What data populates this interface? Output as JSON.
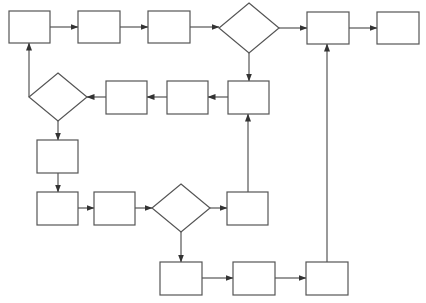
{
  "diagram": {
    "type": "flowchart",
    "stroke_color": "#555555",
    "background": "#ffffff",
    "nodes": [
      {
        "id": "p1",
        "shape": "process",
        "label": "",
        "x": 9,
        "y": 11,
        "w": 41,
        "h": 32
      },
      {
        "id": "p2",
        "shape": "process",
        "label": "",
        "x": 78,
        "y": 11,
        "w": 42,
        "h": 32
      },
      {
        "id": "p3",
        "shape": "process",
        "label": "",
        "x": 148,
        "y": 11,
        "w": 42,
        "h": 32
      },
      {
        "id": "d1",
        "shape": "decision",
        "label": "",
        "cx": 249,
        "cy": 28,
        "rw": 30,
        "rh": 25
      },
      {
        "id": "p4",
        "shape": "process",
        "label": "",
        "x": 307,
        "y": 12,
        "w": 42,
        "h": 32
      },
      {
        "id": "p5",
        "shape": "process",
        "label": "",
        "x": 377,
        "y": 12,
        "w": 42,
        "h": 32
      },
      {
        "id": "p6",
        "shape": "process",
        "label": "",
        "x": 228,
        "y": 81,
        "w": 41,
        "h": 33
      },
      {
        "id": "p7",
        "shape": "process",
        "label": "",
        "x": 167,
        "y": 81,
        "w": 41,
        "h": 33
      },
      {
        "id": "p8",
        "shape": "process",
        "label": "",
        "x": 106,
        "y": 81,
        "w": 41,
        "h": 33
      },
      {
        "id": "d2",
        "shape": "decision",
        "label": "",
        "cx": 58,
        "cy": 97,
        "rw": 29,
        "rh": 24
      },
      {
        "id": "p9",
        "shape": "process",
        "label": "",
        "x": 37,
        "y": 140,
        "w": 41,
        "h": 33
      },
      {
        "id": "p10",
        "shape": "process",
        "label": "",
        "x": 37,
        "y": 192,
        "w": 41,
        "h": 33
      },
      {
        "id": "p11",
        "shape": "process",
        "label": "",
        "x": 94,
        "y": 192,
        "w": 41,
        "h": 33
      },
      {
        "id": "d3",
        "shape": "decision",
        "label": "",
        "cx": 181,
        "cy": 208,
        "rw": 29,
        "rh": 24
      },
      {
        "id": "p12",
        "shape": "process",
        "label": "",
        "x": 227,
        "y": 192,
        "w": 41,
        "h": 33
      },
      {
        "id": "p13",
        "shape": "process",
        "label": "",
        "x": 160,
        "y": 262,
        "w": 42,
        "h": 33
      },
      {
        "id": "p14",
        "shape": "process",
        "label": "",
        "x": 233,
        "y": 262,
        "w": 42,
        "h": 33
      },
      {
        "id": "p15",
        "shape": "process",
        "label": "",
        "x": 306,
        "y": 262,
        "w": 42,
        "h": 33
      }
    ],
    "edges": [
      {
        "from": "p1",
        "to": "p2",
        "points": [
          [
            50,
            27
          ],
          [
            78,
            27
          ]
        ]
      },
      {
        "from": "p2",
        "to": "p3",
        "points": [
          [
            120,
            27
          ],
          [
            148,
            27
          ]
        ]
      },
      {
        "from": "p3",
        "to": "d1",
        "points": [
          [
            190,
            27
          ],
          [
            219,
            27
          ]
        ]
      },
      {
        "from": "d1",
        "to": "p4",
        "points": [
          [
            279,
            28
          ],
          [
            307,
            28
          ]
        ]
      },
      {
        "from": "p4",
        "to": "p5",
        "points": [
          [
            349,
            28
          ],
          [
            377,
            28
          ]
        ]
      },
      {
        "from": "d1",
        "to": "p6",
        "points": [
          [
            249,
            53
          ],
          [
            249,
            81
          ]
        ]
      },
      {
        "from": "p6",
        "to": "p7",
        "points": [
          [
            228,
            97
          ],
          [
            208,
            97
          ]
        ]
      },
      {
        "from": "p7",
        "to": "p8",
        "points": [
          [
            167,
            97
          ],
          [
            147,
            97
          ]
        ]
      },
      {
        "from": "p8",
        "to": "d2",
        "points": [
          [
            106,
            97
          ],
          [
            87,
            97
          ]
        ]
      },
      {
        "from": "d2",
        "to": "p1",
        "points": [
          [
            29,
            97
          ],
          [
            29,
            43
          ]
        ]
      },
      {
        "from": "d2",
        "to": "p9",
        "points": [
          [
            58,
            121
          ],
          [
            58,
            140
          ]
        ]
      },
      {
        "from": "p9",
        "to": "p10",
        "points": [
          [
            58,
            173
          ],
          [
            58,
            192
          ]
        ]
      },
      {
        "from": "p10",
        "to": "p11",
        "points": [
          [
            78,
            208
          ],
          [
            94,
            208
          ]
        ]
      },
      {
        "from": "p11",
        "to": "d3",
        "points": [
          [
            135,
            208
          ],
          [
            152,
            208
          ]
        ]
      },
      {
        "from": "d3",
        "to": "p12",
        "points": [
          [
            210,
            208
          ],
          [
            227,
            208
          ]
        ]
      },
      {
        "from": "p12",
        "to": "p6",
        "points": [
          [
            248,
            192
          ],
          [
            248,
            114
          ]
        ]
      },
      {
        "from": "d3",
        "to": "p13",
        "points": [
          [
            181,
            232
          ],
          [
            181,
            262
          ]
        ]
      },
      {
        "from": "p13",
        "to": "p14",
        "points": [
          [
            202,
            278
          ],
          [
            233,
            278
          ]
        ]
      },
      {
        "from": "p14",
        "to": "p15",
        "points": [
          [
            275,
            278
          ],
          [
            306,
            278
          ]
        ]
      },
      {
        "from": "p15",
        "to": "p4",
        "points": [
          [
            327,
            262
          ],
          [
            327,
            44
          ]
        ]
      }
    ]
  }
}
